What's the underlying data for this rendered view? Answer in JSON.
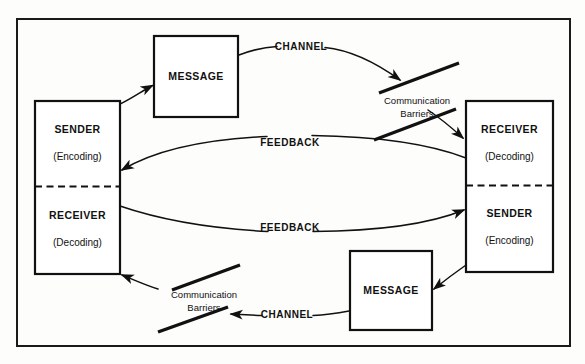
{
  "figure": {
    "background_color": "#fdfdfc",
    "line_color": "#111111",
    "border_color": "#1a1a1a"
  },
  "nodes": {
    "left_party": {
      "top_role": "SENDER",
      "top_function": "(Encoding)",
      "bottom_role": "RECEIVER",
      "bottom_function": "(Decoding)"
    },
    "right_party": {
      "top_role": "RECEIVER",
      "top_function": "(Decoding)",
      "bottom_role": "SENDER",
      "bottom_function": "(Encoding)"
    },
    "message_top": {
      "label": "MESSAGE"
    },
    "message_bottom": {
      "label": "MESSAGE"
    }
  },
  "edges": {
    "channel_top": "CHANNEL",
    "channel_bottom": "CHANNEL",
    "feedback_upper": "FEEDBACK",
    "feedback_lower": "FEEDBACK"
  },
  "barriers": {
    "top_right": {
      "line_one": "Communication",
      "line_two": "Barriers"
    },
    "bottom_left": {
      "line_one": "Communication",
      "line_two": "Barriers"
    }
  }
}
